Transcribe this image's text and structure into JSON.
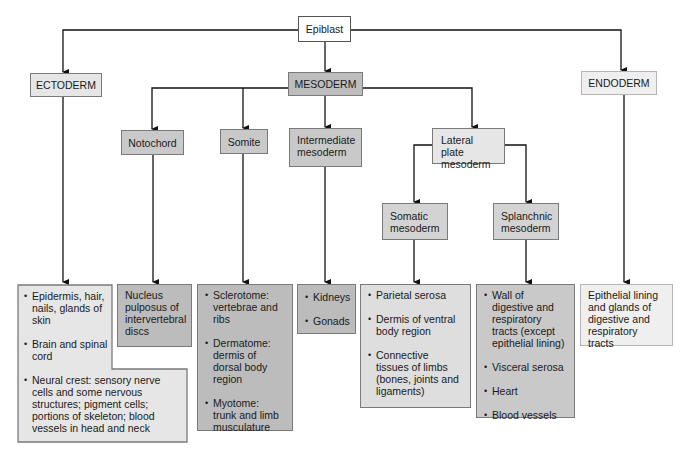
{
  "diagram": {
    "root": {
      "label": "Epiblast"
    },
    "germ_layers": {
      "ectoderm": {
        "label": "ECTODERM"
      },
      "mesoderm": {
        "label": "MESODERM"
      },
      "endoderm": {
        "label": "ENDODERM"
      }
    },
    "mesoderm_branches": {
      "notochord": {
        "label": "Notochord"
      },
      "somite": {
        "label": "Somite"
      },
      "intermediate": {
        "label": "Intermediate\nmesoderm"
      },
      "lateral_plate": {
        "label": "Lateral plate\nmesoderm"
      }
    },
    "lateral_plate_branches": {
      "somatic": {
        "label": "Somatic\nmesoderm"
      },
      "splanchnic": {
        "label": "Splanchnic\nmesoderm"
      }
    },
    "derivatives": {
      "ectoderm": [
        "Epidermis, hair, nails, glands of skin",
        "Brain and spinal cord",
        "Neural crest: sensory nerve cells and some nervous structures; pigment cells; portions of skeleton; blood vessels in head and neck"
      ],
      "notochord": "Nucleus pulposus of intervertebral discs",
      "somite": [
        "Sclerotome: vertebrae and ribs",
        "Dermatome: dermis of dorsal body region",
        "Myotome: trunk and limb musculature"
      ],
      "intermediate": [
        "Kidneys",
        "Gonads"
      ],
      "somatic": [
        "Parietal serosa",
        "Dermis of ventral body region",
        "Connective tissues of limbs (bones, joints and ligaments)"
      ],
      "splanchnic": [
        "Wall of digestive and respiratory tracts (except epithelial lining)",
        "Visceral serosa",
        "Heart",
        "Blood vessels"
      ],
      "endoderm": "Epithelial lining and glands of digestive and respiratory tracts"
    }
  }
}
